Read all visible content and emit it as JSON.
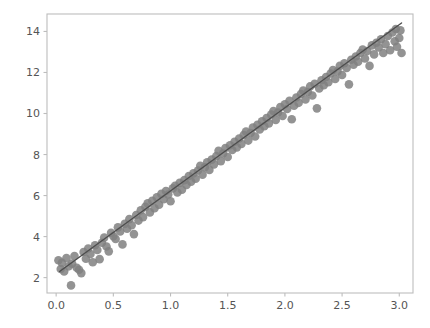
{
  "chart_data": {
    "type": "scatter",
    "title": "",
    "subtitle": "",
    "xlabel": "",
    "ylabel": "",
    "xlim": [
      -0.08,
      3.12
    ],
    "ylim": [
      1.25,
      14.85
    ],
    "xticks": [
      0.0,
      0.5,
      1.0,
      1.5,
      2.0,
      2.5,
      3.0
    ],
    "xtick_labels": [
      "0.0",
      "0.5",
      "1.0",
      "1.5",
      "2.0",
      "2.5",
      "3.0"
    ],
    "yticks": [
      2,
      4,
      6,
      8,
      10,
      12,
      14
    ],
    "ytick_labels": [
      "2",
      "4",
      "6",
      "8",
      "10",
      "12",
      "14"
    ],
    "grid": false,
    "legend": null,
    "marker": "circle",
    "marker_color": "#808080",
    "marker_size": 7,
    "marker_alpha": 0.85,
    "line_color": "#4d4d4d",
    "line_width": 1.4,
    "frame_color": "#bdbdbd",
    "background": "#ffffff",
    "fit_line": {
      "label": "linear fit",
      "slope": 4.05,
      "intercept": 2.18,
      "x_start": 0.03,
      "x_end": 3.02,
      "y_start": 2.3,
      "y_end": 14.41
    },
    "series": [
      {
        "name": "observations",
        "points": [
          [
            0.02,
            2.85
          ],
          [
            0.04,
            2.42
          ],
          [
            0.05,
            2.72
          ],
          [
            0.07,
            2.3
          ],
          [
            0.09,
            2.95
          ],
          [
            0.11,
            2.55
          ],
          [
            0.13,
            1.62
          ],
          [
            0.14,
            2.68
          ],
          [
            0.16,
            3.05
          ],
          [
            0.18,
            2.48
          ],
          [
            0.2,
            2.38
          ],
          [
            0.22,
            2.22
          ],
          [
            0.24,
            3.25
          ],
          [
            0.26,
            2.92
          ],
          [
            0.28,
            3.42
          ],
          [
            0.3,
            3.15
          ],
          [
            0.32,
            2.75
          ],
          [
            0.34,
            3.58
          ],
          [
            0.36,
            3.35
          ],
          [
            0.38,
            2.9
          ],
          [
            0.4,
            3.7
          ],
          [
            0.42,
            3.95
          ],
          [
            0.44,
            3.52
          ],
          [
            0.46,
            3.28
          ],
          [
            0.48,
            4.18
          ],
          [
            0.5,
            4.02
          ],
          [
            0.52,
            3.88
          ],
          [
            0.54,
            4.45
          ],
          [
            0.56,
            4.25
          ],
          [
            0.58,
            3.62
          ],
          [
            0.6,
            4.62
          ],
          [
            0.62,
            4.38
          ],
          [
            0.64,
            4.85
          ],
          [
            0.66,
            4.55
          ],
          [
            0.68,
            4.12
          ],
          [
            0.7,
            5.05
          ],
          [
            0.72,
            4.78
          ],
          [
            0.74,
            5.28
          ],
          [
            0.76,
            4.95
          ],
          [
            0.78,
            5.45
          ],
          [
            0.8,
            5.62
          ],
          [
            0.82,
            5.18
          ],
          [
            0.84,
            5.75
          ],
          [
            0.86,
            5.38
          ],
          [
            0.88,
            5.92
          ],
          [
            0.9,
            5.55
          ],
          [
            0.92,
            6.08
          ],
          [
            0.94,
            5.82
          ],
          [
            0.96,
            6.22
          ],
          [
            0.98,
            6.05
          ],
          [
            1.0,
            5.72
          ],
          [
            1.02,
            6.35
          ],
          [
            1.04,
            6.48
          ],
          [
            1.06,
            6.15
          ],
          [
            1.08,
            6.62
          ],
          [
            1.1,
            6.28
          ],
          [
            1.12,
            6.75
          ],
          [
            1.14,
            6.52
          ],
          [
            1.16,
            6.95
          ],
          [
            1.18,
            6.68
          ],
          [
            1.2,
            7.08
          ],
          [
            1.22,
            6.82
          ],
          [
            1.24,
            7.22
          ],
          [
            1.26,
            7.45
          ],
          [
            1.28,
            7.02
          ],
          [
            1.3,
            7.38
          ],
          [
            1.32,
            7.62
          ],
          [
            1.34,
            7.25
          ],
          [
            1.36,
            7.75
          ],
          [
            1.38,
            7.52
          ],
          [
            1.4,
            7.92
          ],
          [
            1.42,
            8.18
          ],
          [
            1.44,
            7.68
          ],
          [
            1.46,
            8.05
          ],
          [
            1.48,
            8.32
          ],
          [
            1.5,
            7.88
          ],
          [
            1.52,
            8.45
          ],
          [
            1.54,
            8.22
          ],
          [
            1.56,
            8.62
          ],
          [
            1.58,
            8.35
          ],
          [
            1.6,
            8.78
          ],
          [
            1.62,
            8.52
          ],
          [
            1.64,
            8.95
          ],
          [
            1.66,
            9.12
          ],
          [
            1.68,
            8.68
          ],
          [
            1.7,
            9.05
          ],
          [
            1.72,
            9.32
          ],
          [
            1.74,
            8.88
          ],
          [
            1.76,
            9.45
          ],
          [
            1.78,
            9.22
          ],
          [
            1.8,
            9.62
          ],
          [
            1.82,
            9.38
          ],
          [
            1.84,
            9.78
          ],
          [
            1.86,
            9.52
          ],
          [
            1.88,
            9.95
          ],
          [
            1.9,
            10.12
          ],
          [
            1.92,
            9.68
          ],
          [
            1.94,
            10.05
          ],
          [
            1.96,
            10.32
          ],
          [
            1.98,
            9.88
          ],
          [
            2.0,
            10.45
          ],
          [
            2.02,
            10.22
          ],
          [
            2.04,
            10.62
          ],
          [
            2.06,
            9.72
          ],
          [
            2.08,
            10.38
          ],
          [
            2.1,
            10.78
          ],
          [
            2.12,
            10.52
          ],
          [
            2.14,
            10.95
          ],
          [
            2.16,
            11.12
          ],
          [
            2.18,
            10.68
          ],
          [
            2.2,
            11.05
          ],
          [
            2.22,
            11.32
          ],
          [
            2.24,
            10.88
          ],
          [
            2.26,
            11.45
          ],
          [
            2.28,
            10.25
          ],
          [
            2.3,
            11.22
          ],
          [
            2.32,
            11.62
          ],
          [
            2.34,
            11.38
          ],
          [
            2.36,
            11.78
          ],
          [
            2.38,
            11.52
          ],
          [
            2.4,
            11.95
          ],
          [
            2.42,
            12.12
          ],
          [
            2.44,
            11.68
          ],
          [
            2.46,
            12.05
          ],
          [
            2.48,
            12.32
          ],
          [
            2.5,
            11.88
          ],
          [
            2.52,
            12.45
          ],
          [
            2.54,
            12.22
          ],
          [
            2.56,
            11.42
          ],
          [
            2.58,
            12.62
          ],
          [
            2.6,
            12.38
          ],
          [
            2.62,
            12.78
          ],
          [
            2.64,
            12.52
          ],
          [
            2.66,
            12.95
          ],
          [
            2.68,
            13.12
          ],
          [
            2.7,
            12.68
          ],
          [
            2.72,
            13.05
          ],
          [
            2.74,
            12.32
          ],
          [
            2.76,
            13.32
          ],
          [
            2.78,
            12.88
          ],
          [
            2.8,
            13.45
          ],
          [
            2.82,
            13.22
          ],
          [
            2.84,
            13.62
          ],
          [
            2.86,
            12.95
          ],
          [
            2.88,
            13.38
          ],
          [
            2.9,
            13.78
          ],
          [
            2.92,
            13.08
          ],
          [
            2.94,
            13.95
          ],
          [
            2.96,
            13.52
          ],
          [
            2.97,
            14.12
          ],
          [
            2.98,
            13.25
          ],
          [
            3.0,
            13.68
          ],
          [
            3.01,
            14.05
          ],
          [
            3.02,
            12.95
          ]
        ]
      }
    ]
  }
}
